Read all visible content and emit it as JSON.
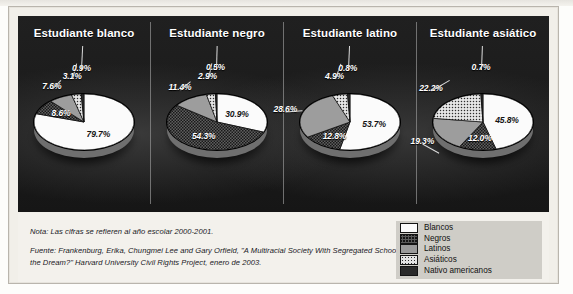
{
  "figure": {
    "panels": [
      {
        "title": "Estudiante blanco",
        "slices": [
          {
            "group": "Blancos",
            "value": 79.7,
            "label": "79.7%",
            "pattern": "blancos"
          },
          {
            "group": "Negros",
            "value": 8.6,
            "label": "8.6%",
            "pattern": "negros"
          },
          {
            "group": "Latinos",
            "value": 7.6,
            "label": "7.6%",
            "pattern": "latinos"
          },
          {
            "group": "Asiáticos",
            "value": 3.1,
            "label": "3.1%",
            "pattern": "asiaticos"
          },
          {
            "group": "Nativo americanos",
            "value": 0.9,
            "label": "0.9%",
            "pattern": "nativos"
          }
        ]
      },
      {
        "title": "Estudiante negro",
        "slices": [
          {
            "group": "Blancos",
            "value": 30.9,
            "label": "30.9%",
            "pattern": "blancos"
          },
          {
            "group": "Negros",
            "value": 54.3,
            "label": "54.3%",
            "pattern": "negros"
          },
          {
            "group": "Latinos",
            "value": 11.4,
            "label": "11.4%",
            "pattern": "latinos"
          },
          {
            "group": "Asiáticos",
            "value": 2.9,
            "label": "2.9%",
            "pattern": "asiaticos"
          },
          {
            "group": "Nativo americanos",
            "value": 0.5,
            "label": "0.5%",
            "pattern": "nativos"
          }
        ]
      },
      {
        "title": "Estudiante latino",
        "slices": [
          {
            "group": "Blancos",
            "value": 53.7,
            "label": "53.7%",
            "pattern": "blancos"
          },
          {
            "group": "Negros",
            "value": 12.8,
            "label": "12.8%",
            "pattern": "negros"
          },
          {
            "group": "Latinos",
            "value": 28.6,
            "label": "28.6%",
            "pattern": "latinos"
          },
          {
            "group": "Asiáticos",
            "value": 4.9,
            "label": "4.9%",
            "pattern": "asiaticos"
          },
          {
            "group": "Nativo americanos",
            "value": 0.8,
            "label": "0.8%",
            "pattern": "nativos"
          }
        ]
      },
      {
        "title": "Estudiante asiático",
        "slices": [
          {
            "group": "Blancos",
            "value": 45.8,
            "label": "45.8%",
            "pattern": "blancos"
          },
          {
            "group": "Negros",
            "value": 12.0,
            "label": "12.0%",
            "pattern": "negros"
          },
          {
            "group": "Latinos",
            "value": 19.3,
            "label": "19.3%",
            "pattern": "latinos"
          },
          {
            "group": "Asiáticos",
            "value": 22.2,
            "label": "22.2%",
            "pattern": "asiaticos"
          },
          {
            "group": "Nativo americanos",
            "value": 0.7,
            "label": "0.7%",
            "pattern": "nativos"
          }
        ]
      }
    ]
  },
  "legend": {
    "items": [
      {
        "label": "Blancos",
        "pattern": "blancos"
      },
      {
        "label": "Negros",
        "pattern": "negros"
      },
      {
        "label": "Latinos",
        "pattern": "latinos"
      },
      {
        "label": "Asiáticos",
        "pattern": "asiaticos"
      },
      {
        "label": "Nativo americanos",
        "pattern": "nativos"
      }
    ]
  },
  "notes": {
    "note": "Nota: Las cifras se refieren al año escolar 2000-2001.",
    "source_line1": "Fuente: Frankenburg, Erika, Chungmei Lee and Gary Orfield, \"A Multiracial Society With Segregated Schools: Are We Losing",
    "source_line2": "the Dream?\" Harvard University Civil Rights Project, enero de 2003."
  },
  "chart_data": {
    "type": "pie",
    "categories": [
      "Blancos",
      "Negros",
      "Latinos",
      "Asiáticos",
      "Nativo americanos"
    ],
    "charts": [
      {
        "name": "Estudiante blanco",
        "values": [
          79.7,
          8.6,
          7.6,
          3.1,
          0.9
        ]
      },
      {
        "name": "Estudiante negro",
        "values": [
          30.9,
          54.3,
          11.4,
          2.9,
          0.5
        ]
      },
      {
        "name": "Estudiante latino",
        "values": [
          53.7,
          12.8,
          28.6,
          4.9,
          0.8
        ]
      },
      {
        "name": "Estudiante asiático",
        "values": [
          45.8,
          12.0,
          19.3,
          22.2,
          0.7
        ]
      }
    ],
    "units": "percent",
    "legend_position": "bottom-right",
    "grid": false,
    "note": "Nota: Las cifras se refieren al año escolar 2000-2001.",
    "source": "Fuente: Frankenburg, Erika, Chungmei Lee and Gary Orfield, \"A Multiracial Society With Segregated Schools: Are We Losing the Dream?\" Harvard University Civil Rights Project, enero de 2003."
  }
}
